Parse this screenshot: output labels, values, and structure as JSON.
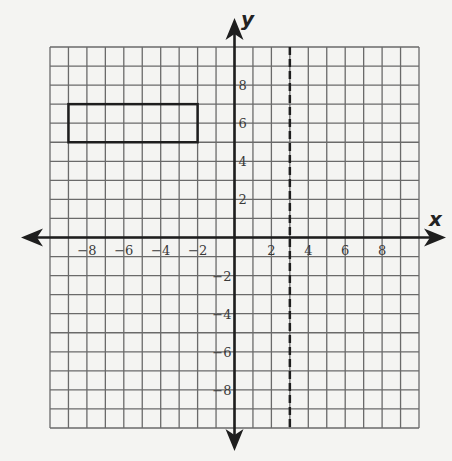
{
  "figure": {
    "type": "coordinate-plane",
    "background": "#f4f4f2",
    "grid_color": "#6a6a6a",
    "axis_color": "#1e1e1e",
    "shape_color": "#1e1e1e"
  },
  "axes": {
    "x_label": "x",
    "y_label": "y",
    "x_range": [
      -10,
      10
    ],
    "y_range": [
      -10,
      10
    ],
    "grid_step": 1,
    "x_ticks": [
      {
        "value": -8,
        "label": "−8"
      },
      {
        "value": -6,
        "label": "−6"
      },
      {
        "value": -4,
        "label": "−4"
      },
      {
        "value": -2,
        "label": "−2"
      },
      {
        "value": 2,
        "label": "2"
      },
      {
        "value": 4,
        "label": "4"
      },
      {
        "value": 6,
        "label": "6"
      },
      {
        "value": 8,
        "label": "8"
      }
    ],
    "y_ticks": [
      {
        "value": 8,
        "label": "8"
      },
      {
        "value": 6,
        "label": "6"
      },
      {
        "value": 4,
        "label": "4"
      },
      {
        "value": 2,
        "label": "2"
      },
      {
        "value": -2,
        "label": "−2"
      },
      {
        "value": -4,
        "label": "−4"
      },
      {
        "value": -6,
        "label": "−6"
      },
      {
        "value": -8,
        "label": "−8"
      }
    ]
  },
  "shapes": {
    "rectangle": {
      "vertices": [
        [
          -9,
          7
        ],
        [
          -2,
          7
        ],
        [
          -2,
          5
        ],
        [
          -9,
          5
        ]
      ],
      "stroke_width": 2.5
    },
    "dashed_line": {
      "equation": "x = 3",
      "x": 3,
      "style": "dashed"
    }
  }
}
